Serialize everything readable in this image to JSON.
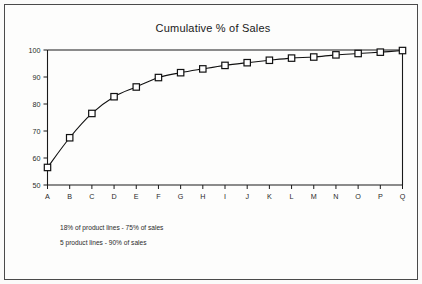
{
  "chart_data": {
    "type": "line",
    "title": "Cumulative % of Sales",
    "xlabel": "",
    "ylabel": "",
    "categories": [
      "A",
      "B",
      "C",
      "D",
      "E",
      "F",
      "G",
      "H",
      "I",
      "J",
      "K",
      "L",
      "M",
      "N",
      "O",
      "P",
      "Q"
    ],
    "values": [
      56.5,
      67.5,
      76.5,
      82.7,
      86.3,
      89.8,
      91.6,
      93.0,
      94.3,
      95.3,
      96.2,
      97.0,
      97.4,
      98.2,
      98.7,
      99.2,
      99.8
    ],
    "series": [
      {
        "name": "Cumulative % of Sales",
        "values": [
          56.5,
          67.5,
          76.5,
          82.7,
          86.3,
          89.8,
          91.6,
          93.0,
          94.3,
          95.3,
          96.2,
          97.0,
          97.4,
          98.2,
          98.7,
          99.2,
          99.8
        ]
      }
    ],
    "ylim": [
      50,
      100
    ],
    "yticks": [
      50,
      60,
      70,
      80,
      90,
      100
    ],
    "ytick_labels": [
      "50",
      "60",
      "70",
      "80",
      "90",
      "100"
    ],
    "xtick_labels": [
      "A",
      "B",
      "C",
      "D",
      "E",
      "F",
      "G",
      "H",
      "I",
      "J",
      "K",
      "L",
      "M",
      "N",
      "O",
      "P",
      "Q"
    ],
    "grid": false,
    "legend": false,
    "legend_position": "none",
    "marker": "open-square",
    "annotations": [
      "18% of product lines  -  75% of sales",
      "5 product lines  -  90% of sales"
    ]
  },
  "colors": {
    "line": "#111111",
    "marker_fill": "#ffffff",
    "marker_stroke": "#111111",
    "axis": "#1a1a1a",
    "text": "#2a2a2a",
    "frame": "#4a4a4a",
    "background": "#fdfdfc"
  },
  "notes": {
    "line1": "18% of product lines  -  75% of sales",
    "line2": "5 product lines  -  90% of sales"
  }
}
